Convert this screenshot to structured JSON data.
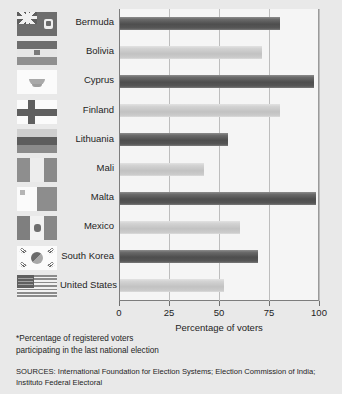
{
  "chart_data": {
    "type": "bar",
    "orientation": "horizontal",
    "title": "",
    "xlabel": "Percentage of voters",
    "ylabel": "",
    "xlim": [
      0,
      100
    ],
    "xticks": [
      0,
      25,
      50,
      75,
      100
    ],
    "grid": true,
    "legend": false,
    "categories": [
      "Bermuda",
      "Bolivia",
      "Cyprus",
      "Finland",
      "Lithuania",
      "Mali",
      "Malta",
      "Mexico",
      "South Korea",
      "United States"
    ],
    "values": [
      80,
      71,
      97,
      80,
      54,
      42,
      98,
      60,
      69,
      52
    ],
    "bar_shades": [
      "dark",
      "light",
      "dark",
      "light",
      "dark",
      "light",
      "dark",
      "light",
      "dark",
      "light"
    ],
    "flags": [
      "bermuda",
      "bolivia",
      "cyprus",
      "finland",
      "lithuania",
      "mali",
      "malta",
      "mexico",
      "south-korea",
      "united-states"
    ],
    "annotations": [
      "*Percentage of registered voters participating in the last national election"
    ]
  },
  "axis": {
    "title": "Percentage of voters",
    "tick_labels": [
      "0",
      "25",
      "50",
      "75",
      "100"
    ]
  },
  "footnote": {
    "line1": "*Percentage of registered voters",
    "line2": "participating in the last national election"
  },
  "sources": {
    "line1": "SOURCES: International Foundation for Election Systems; Election Commission of India;",
    "line2": "Instituto Federal Electoral"
  },
  "colors": {
    "background": "#e9e9e9",
    "plot_background": "#f5f5f5",
    "bar_dark": "#4e4e4e",
    "bar_light": "#c6c6c6",
    "gridline": "#bdbdbd",
    "text": "#242424"
  }
}
